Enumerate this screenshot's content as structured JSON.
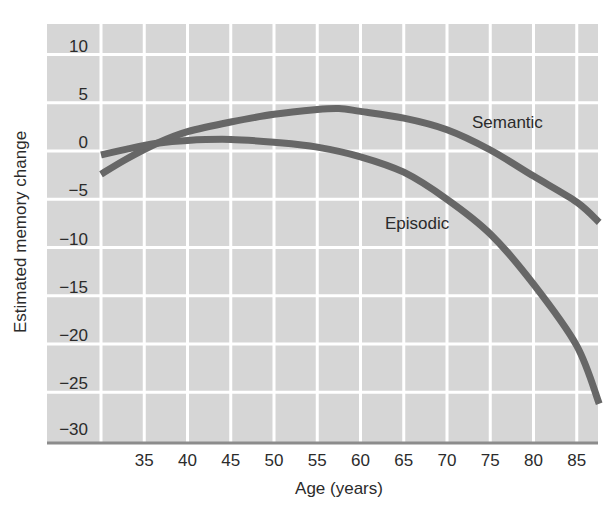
{
  "chart_data": {
    "type": "line",
    "title": "",
    "xlabel": "Age (years)",
    "ylabel": "Estimated memory change",
    "xlim": [
      23.7,
      87.7
    ],
    "ylim": [
      -30,
      13
    ],
    "grid": true,
    "legend": "inline labels",
    "x_ticks": [
      35,
      40,
      45,
      50,
      55,
      60,
      65,
      70,
      75,
      80,
      85
    ],
    "x_gridlines": [
      30,
      35,
      40,
      45,
      50,
      55,
      60,
      65,
      70,
      75,
      80,
      85
    ],
    "y_ticks": [
      10,
      5,
      0,
      -5,
      -10,
      -15,
      -20,
      -25,
      -30
    ],
    "y_gridlines": [
      10,
      5,
      0,
      -5,
      -10,
      -15,
      -20,
      -25
    ],
    "series": [
      {
        "name": "Semantic",
        "label_pos": {
          "x": 472,
          "y": 128
        },
        "points": [
          [
            30,
            -2.4
          ],
          [
            33,
            -0.8
          ],
          [
            36.5,
            0.8
          ],
          [
            40,
            2.0
          ],
          [
            45,
            3.0
          ],
          [
            50,
            3.8
          ],
          [
            55,
            4.3
          ],
          [
            57.5,
            4.4
          ],
          [
            60,
            4.1
          ],
          [
            65,
            3.4
          ],
          [
            70,
            2.2
          ],
          [
            75,
            0.1
          ],
          [
            80,
            -2.6
          ],
          [
            85,
            -5.3
          ],
          [
            87.6,
            -7.4
          ]
        ]
      },
      {
        "name": "Episodic",
        "label_pos": {
          "x": 385,
          "y": 229
        },
        "points": [
          [
            30,
            -0.4
          ],
          [
            33,
            0.2
          ],
          [
            36.5,
            0.8
          ],
          [
            40,
            1.1
          ],
          [
            45,
            1.2
          ],
          [
            50,
            0.9
          ],
          [
            55,
            0.4
          ],
          [
            60,
            -0.6
          ],
          [
            65,
            -2.2
          ],
          [
            70,
            -5.0
          ],
          [
            75,
            -8.6
          ],
          [
            80,
            -13.8
          ],
          [
            85,
            -20.2
          ],
          [
            87.6,
            -26.2
          ]
        ]
      }
    ]
  },
  "style": {
    "plot_bg": "#d6d6d6",
    "grid_color": "#ffffff",
    "line_color": "#676767",
    "axis_color": "#8c8c8c",
    "text_color": "#2b2b2b"
  }
}
